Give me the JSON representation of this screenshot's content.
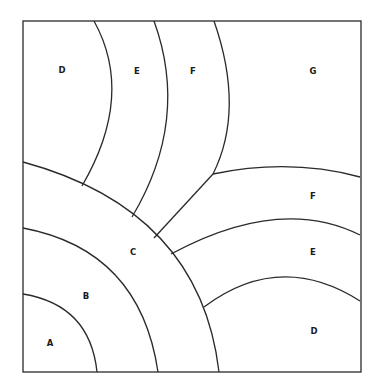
{
  "diagram": {
    "type": "zone-map",
    "frame": {
      "x": 23,
      "y": 21,
      "width": 338,
      "height": 351
    },
    "colors": {
      "line": "#2a2a2a",
      "text": "#1a1a1a",
      "background": "#ffffff"
    },
    "labels": [
      {
        "id": "A",
        "text": "A",
        "x": 50,
        "y": 343
      },
      {
        "id": "B",
        "text": "B",
        "x": 86,
        "y": 296
      },
      {
        "id": "C",
        "text": "C",
        "x": 133,
        "y": 252
      },
      {
        "id": "D-top",
        "text": "D",
        "x": 62,
        "y": 70
      },
      {
        "id": "E-top",
        "text": "E",
        "x": 137,
        "y": 71
      },
      {
        "id": "F-top",
        "text": "F",
        "x": 193,
        "y": 71
      },
      {
        "id": "G",
        "text": "G",
        "x": 313,
        "y": 71
      },
      {
        "id": "F-right",
        "text": "F",
        "x": 313,
        "y": 196
      },
      {
        "id": "E-right",
        "text": "E",
        "x": 313,
        "y": 252
      },
      {
        "id": "D-right",
        "text": "D",
        "x": 314,
        "y": 331
      }
    ],
    "boundaries": [
      {
        "name": "arc-A-B",
        "d": "M23,294 Q90,305 97,372"
      },
      {
        "name": "arc-B-C",
        "d": "M23,228 Q140,250 158,372"
      },
      {
        "name": "arc-C-outer",
        "d": "M23,162 Q200,210 219,372"
      },
      {
        "name": "curve-D-E-top",
        "d": "M94,21 Q135,95 82,186"
      },
      {
        "name": "curve-E-F-top",
        "d": "M154,21 Q190,120 132,217"
      },
      {
        "name": "curve-F-G-top",
        "d": "M214,21 Q245,110 213,174"
      },
      {
        "name": "line-F-G-diagonal",
        "d": "M213,174 L154,238"
      },
      {
        "name": "arc-F-G-right",
        "d": "M213,174 Q290,158 360,177"
      },
      {
        "name": "arc-E-F-right",
        "d": "M171,254 Q280,195 360,235"
      },
      {
        "name": "arc-D-E-right",
        "d": "M204,307 Q280,250 360,301"
      }
    ]
  }
}
